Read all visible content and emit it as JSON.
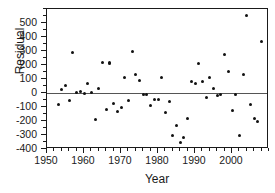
{
  "chart_data": {
    "type": "scatter",
    "title": "",
    "xlabel": "Year",
    "ylabel": "Residual",
    "xlim": [
      1950,
      2010
    ],
    "ylim": [
      -400,
      600
    ],
    "grid": false,
    "legend": null,
    "reference_line": {
      "orientation": "horizontal",
      "value": 0
    },
    "x_ticks_major": [
      1950,
      1960,
      1970,
      1980,
      1990,
      2000
    ],
    "x_tick_labels": [
      "1950",
      "1960",
      "1970",
      "1980",
      "1990",
      "2000"
    ],
    "x_minor_step": 2,
    "y_ticks_major": [
      -400,
      -300,
      -200,
      -100,
      0,
      100,
      200,
      300,
      400,
      500
    ],
    "y_tick_labels": [
      "-400",
      "-300",
      "-200",
      "-100",
      "0",
      "100",
      "200",
      "300",
      "400",
      "500"
    ],
    "y_minor_step": 50,
    "marker": "filled-circle",
    "marker_color": "#111111",
    "points": [
      {
        "x": 1953,
        "y": -85
      },
      {
        "x": 1954,
        "y": 25
      },
      {
        "x": 1955,
        "y": 55
      },
      {
        "x": 1956,
        "y": -50
      },
      {
        "x": 1957,
        "y": 290
      },
      {
        "x": 1958,
        "y": 5
      },
      {
        "x": 1959,
        "y": 10
      },
      {
        "x": 1960,
        "y": 0
      },
      {
        "x": 1961,
        "y": 70
      },
      {
        "x": 1962,
        "y": 5
      },
      {
        "x": 1963,
        "y": -190
      },
      {
        "x": 1964,
        "y": 35
      },
      {
        "x": 1965,
        "y": 215
      },
      {
        "x": 1966,
        "y": -115
      },
      {
        "x": 1967,
        "y": 215
      },
      {
        "x": 1967,
        "y": 210
      },
      {
        "x": 1968,
        "y": -75
      },
      {
        "x": 1969,
        "y": -135
      },
      {
        "x": 1970,
        "y": -105
      },
      {
        "x": 1971,
        "y": 110
      },
      {
        "x": 1972,
        "y": -50
      },
      {
        "x": 1973,
        "y": 300
      },
      {
        "x": 1974,
        "y": 130
      },
      {
        "x": 1975,
        "y": 90
      },
      {
        "x": 1976,
        "y": -10
      },
      {
        "x": 1977,
        "y": -10
      },
      {
        "x": 1978,
        "y": -90
      },
      {
        "x": 1979,
        "y": -45
      },
      {
        "x": 1980,
        "y": -45
      },
      {
        "x": 1981,
        "y": 110
      },
      {
        "x": 1982,
        "y": -140
      },
      {
        "x": 1983,
        "y": -60
      },
      {
        "x": 1984,
        "y": -300
      },
      {
        "x": 1985,
        "y": -235
      },
      {
        "x": 1986,
        "y": -355
      },
      {
        "x": 1987,
        "y": -320
      },
      {
        "x": 1988,
        "y": -185
      },
      {
        "x": 1989,
        "y": 85
      },
      {
        "x": 1990,
        "y": 65
      },
      {
        "x": 1991,
        "y": 210
      },
      {
        "x": 1992,
        "y": 80
      },
      {
        "x": 1993,
        "y": -35
      },
      {
        "x": 1994,
        "y": 110
      },
      {
        "x": 1995,
        "y": 30
      },
      {
        "x": 1996,
        "y": -15
      },
      {
        "x": 1997,
        "y": -10
      },
      {
        "x": 1998,
        "y": 275
      },
      {
        "x": 1999,
        "y": 155
      },
      {
        "x": 2000,
        "y": -125
      },
      {
        "x": 2001,
        "y": -10
      },
      {
        "x": 2002,
        "y": -300
      },
      {
        "x": 2003,
        "y": 130
      },
      {
        "x": 2004,
        "y": 555
      },
      {
        "x": 2005,
        "y": -85
      },
      {
        "x": 2006,
        "y": -185
      },
      {
        "x": 2007,
        "y": -205
      },
      {
        "x": 2008,
        "y": 370
      }
    ]
  }
}
